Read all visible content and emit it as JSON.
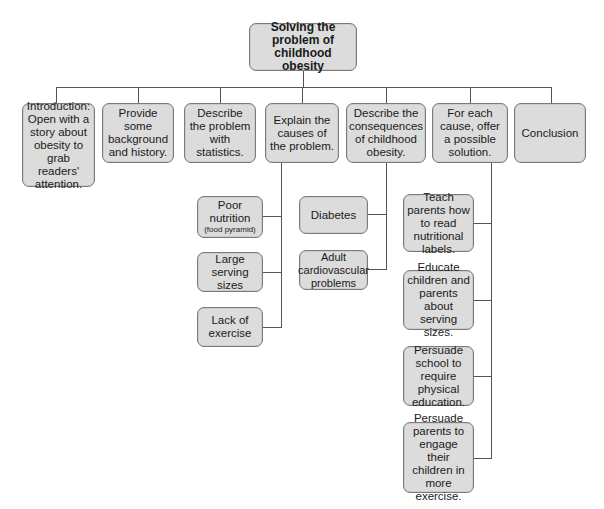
{
  "root": {
    "label": "Solving the problem of childhood obesity"
  },
  "topics": [
    {
      "label": "Introduction: Open with a story about obesity to grab readers' attention."
    },
    {
      "label": "Provide some background and history."
    },
    {
      "label": "Describe the problem with statistics."
    },
    {
      "label": "Explain the causes of the problem."
    },
    {
      "label": "Describe the consequences of childhood obesity."
    },
    {
      "label": "For each cause, offer a possible solution."
    },
    {
      "label": "Conclusion"
    }
  ],
  "causes": [
    {
      "label": "Poor nutrition",
      "note": "(food pyramid)"
    },
    {
      "label": "Large serving sizes"
    },
    {
      "label": "Lack of exercise"
    }
  ],
  "consequences": [
    {
      "label": "Diabetes"
    },
    {
      "label": "Adult cardiovascular problems"
    }
  ],
  "solutions": [
    {
      "label": "Teach parents how to read nutritional labels."
    },
    {
      "label": "Educate children and parents about serving sizes."
    },
    {
      "label": "Persuade school to require physical education."
    },
    {
      "label": "Persuade parents to engage their children in more exercise."
    }
  ],
  "colors": {
    "box_fill": "#dcdcdc",
    "box_border": "#7a7a7a",
    "line": "#555555"
  }
}
